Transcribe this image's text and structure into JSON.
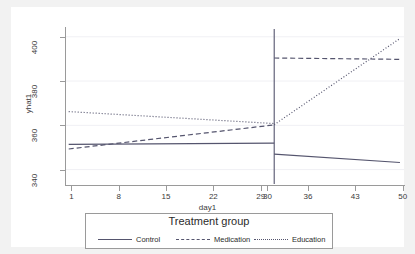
{
  "chart_data": {
    "type": "line",
    "title": "",
    "xlabel": "day1",
    "ylabel": "yhat1",
    "xlim": [
      0.2,
      50.2
    ],
    "ylim": [
      333.5,
      403.5
    ],
    "xticks": [
      1,
      8,
      15,
      22,
      29,
      30,
      36,
      43,
      50
    ],
    "yticks": [
      340,
      360,
      380,
      400
    ],
    "grid": "horizontal-faint",
    "legend_position": "below-plot",
    "legend_title": "Treatment group",
    "annotations": [
      {
        "name": "cutoff-line",
        "type": "vline",
        "x": 31,
        "style": "solid"
      }
    ],
    "series": [
      {
        "name": "Control",
        "style": "solid",
        "color": "#55556e",
        "segments": [
          {
            "x": [
              0.6,
              31.0
            ],
            "y": [
              351.4,
              352.0
            ]
          },
          {
            "x": [
              31.0,
              49.6
            ],
            "y": [
              347.0,
              343.2
            ]
          }
        ]
      },
      {
        "name": "Medication",
        "style": "dashed",
        "color": "#55556e",
        "segments": [
          {
            "x": [
              0.6,
              31.0
            ],
            "y": [
              349.3,
              360.2
            ]
          },
          {
            "x": [
              31.0,
              49.6
            ],
            "y": [
              390.4,
              389.8
            ]
          }
        ]
      },
      {
        "name": "Education",
        "style": "dotted",
        "color": "#55556e",
        "segments": [
          {
            "x": [
              0.6,
              31.0
            ],
            "y": [
              366.2,
              360.8
            ]
          },
          {
            "x": [
              31.0,
              49.6
            ],
            "y": [
              360.3,
              399.2
            ]
          }
        ]
      }
    ]
  },
  "axes": {
    "x_title": "day1",
    "y_title": "yhat1",
    "x_tick_labels": [
      "1",
      "8",
      "15",
      "22",
      "29",
      "30",
      "36",
      "43",
      "50"
    ],
    "y_tick_labels": [
      "340",
      "360",
      "380",
      "400"
    ]
  },
  "legend": {
    "title": "Treatment group",
    "entries": [
      {
        "label": "Control",
        "key": "solid-line-key"
      },
      {
        "label": "Medication",
        "key": "dashed-line-key"
      },
      {
        "label": "Education",
        "key": "dotted-line-key"
      }
    ]
  },
  "colors": {
    "line": "#55556e",
    "axis": "#9a9a9a",
    "text": "#3a3a3a",
    "canvas": "#ffffff",
    "page": "#f2f2f2",
    "grid": "#f0f0f4"
  }
}
